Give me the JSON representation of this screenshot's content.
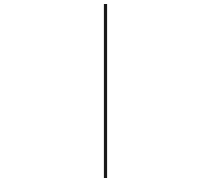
{
  "canvas": {
    "width": 218,
    "height": 184,
    "background_color": "#ffffff"
  },
  "figure": {
    "shapes": [
      {
        "name": "rectangle",
        "type": "rectangle",
        "x": 11.5,
        "y": 26.5,
        "width": 193,
        "height": 130,
        "fill": "none",
        "stroke_color": "#6f6f6f",
        "stroke_width": 1.3
      },
      {
        "name": "vertical-line",
        "type": "line",
        "x1": 105.5,
        "y1": 4,
        "x2": 105.5,
        "y2": 178,
        "stroke_color": "#1a1a1a",
        "stroke_width": 3.2,
        "crosses_rectangle_at_fraction": 0.487
      }
    ]
  }
}
